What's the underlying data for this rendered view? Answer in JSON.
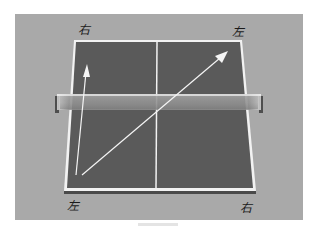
{
  "diagram": {
    "type": "table-tennis-table",
    "labels": {
      "top_left": "右",
      "top_right": "左",
      "bottom_left": "左",
      "bottom_right": "右"
    },
    "arrows": [
      {
        "name": "straight-arrow",
        "from": "bottom-left",
        "to": "top-left",
        "description": "straight line"
      },
      {
        "name": "diagonal-arrow",
        "from": "bottom-left",
        "to": "top-right",
        "description": "diagonal line"
      }
    ],
    "colors": {
      "background": "#a9a9a9",
      "table": "#5a5a5a",
      "lines": "#f2f2f2",
      "net": "#8c8c8c"
    }
  }
}
